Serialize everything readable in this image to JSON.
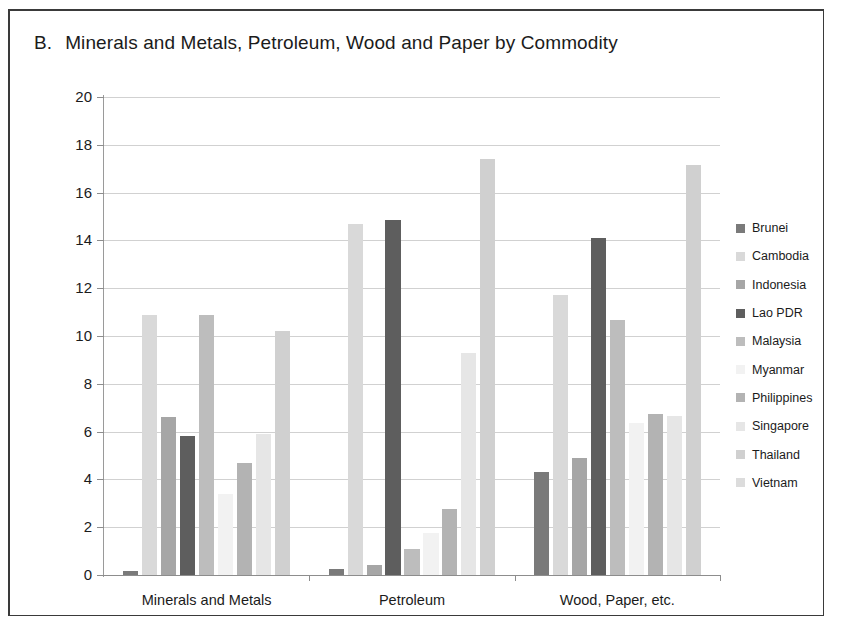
{
  "figure": {
    "panel_letter": "B.",
    "title": "Minerals and Metals, Petroleum, Wood and Paper by Commodity",
    "background": "#ffffff",
    "border_color": "#3a3a3a"
  },
  "chart_data": {
    "type": "bar",
    "xlabel": "",
    "ylabel": "",
    "ylim": [
      0,
      20
    ],
    "ytick_step": 2,
    "yticks": [
      "0",
      "2",
      "4",
      "6",
      "8",
      "10",
      "12",
      "14",
      "16",
      "18",
      "20"
    ],
    "grid": true,
    "grid_axis": "y",
    "legend_position": "right",
    "categories": [
      "Minerals and Metals",
      "Petroleum",
      "Wood, Paper, etc."
    ],
    "series": [
      {
        "name": "Brunei",
        "color": "#7a7a7a",
        "values": [
          0.15,
          0.25,
          4.3
        ]
      },
      {
        "name": "Cambodia",
        "color": "#d9d9d9",
        "values": [
          10.9,
          14.7,
          11.7
        ]
      },
      {
        "name": "Indonesia",
        "color": "#a6a6a6",
        "values": [
          6.6,
          0.4,
          4.9
        ]
      },
      {
        "name": "Lao PDR",
        "color": "#5e5e5e",
        "values": [
          5.8,
          14.85,
          14.1
        ]
      },
      {
        "name": "Malaysia",
        "color": "#bdbdbd",
        "values": [
          10.9,
          1.1,
          10.65
        ]
      },
      {
        "name": "Myanmar",
        "color": "#f2f2f2",
        "values": [
          3.4,
          1.75,
          6.35
        ]
      },
      {
        "name": "Philippines",
        "color": "#b3b3b3",
        "values": [
          4.7,
          2.75,
          6.75
        ]
      },
      {
        "name": "Singapore",
        "color": "#e6e6e6",
        "values": [
          5.9,
          9.3,
          6.65
        ]
      },
      {
        "name": "Thailand",
        "color": "#d0d0d0",
        "values": [
          10.2,
          17.4,
          17.15
        ]
      },
      {
        "name": "Vietnam",
        "color": "#dcdcdc",
        "values": [
          0,
          0,
          0
        ]
      }
    ]
  }
}
